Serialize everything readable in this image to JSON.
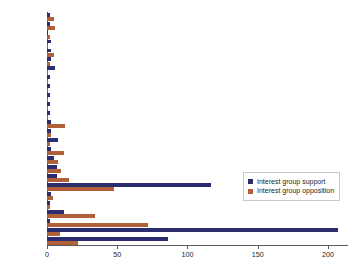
{
  "chart_data": {
    "type": "bar",
    "orientation": "horizontal",
    "title": "",
    "subtitle": "",
    "xlabel": "",
    "ylabel": "",
    "xlim": [
      0,
      215
    ],
    "xticks": [
      0,
      50,
      100,
      150,
      200
    ],
    "xtick_labels": [
      "0",
      "50",
      "100",
      "150",
      "200"
    ],
    "grid": false,
    "legend_position": "center-right",
    "categories": [
      "Warren",
      "Harlan",
      "Brennan",
      "Whitaker",
      "Stewart",
      "White",
      "Goldberg",
      "Fortas",
      "Marshall",
      "Burger",
      "Blackmun",
      "Powell",
      "Rehnquist *",
      "Stevens",
      "O'Connor",
      "Rehnquist †",
      "Scalia",
      "Kennedy",
      "Souter",
      "Thomas",
      "Ginsburg",
      "Breyer",
      "Roberts",
      "Alito",
      "Sotomayor",
      "Kagan"
    ],
    "series": [
      {
        "name": "Interest group support",
        "color": "#2b2d6e",
        "values": [
          2,
          2,
          1,
          3,
          3,
          3,
          6,
          2,
          2,
          2,
          2,
          2,
          3,
          3,
          8,
          3,
          5,
          7,
          7,
          117,
          3,
          2,
          12,
          2,
          207,
          86
        ]
      },
      {
        "name": "Interest group opposition",
        "color": "#b0613a",
        "values": [
          5,
          6,
          2,
          1,
          5,
          2,
          1,
          1,
          1,
          1,
          1,
          1,
          13,
          3,
          2,
          12,
          8,
          10,
          16,
          48,
          4,
          2,
          34,
          72,
          9,
          22
        ]
      }
    ]
  },
  "legend": {
    "items": [
      {
        "label": "Interest group support",
        "color": "#2b2d6e"
      },
      {
        "label": "Interest group opposition",
        "color": "#b0613a"
      }
    ]
  },
  "colors": {
    "support": "#2b2d6e",
    "opposition": "#b0613a",
    "axis": "#58595b",
    "text": "#231f20",
    "background": "#ffffff"
  }
}
